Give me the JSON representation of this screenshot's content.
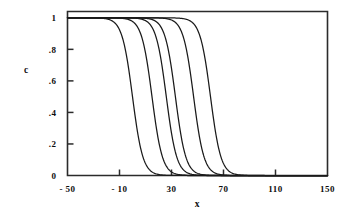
{
  "chart_data": {
    "type": "line",
    "title": "",
    "subtitle": "",
    "xlabel": "x",
    "ylabel": "c",
    "xlim": [
      -50,
      150
    ],
    "ylim": [
      0,
      1.04
    ],
    "grid": false,
    "legend": "none",
    "annotations": [],
    "x_ticks": [
      -50,
      -10,
      30,
      70,
      110,
      150
    ],
    "x_ticklabels": [
      "- 50",
      "- 10",
      "30",
      "70",
      "110",
      "150"
    ],
    "y_ticks": [
      0,
      0.2,
      0.4,
      0.6,
      0.8,
      1
    ],
    "y_ticklabels": [
      "0",
      ".2",
      ".4",
      ".6",
      ".8",
      "1"
    ],
    "y_tickmarks_drawn": [
      0.2,
      0.4,
      0.6,
      0.8
    ],
    "frame": "box",
    "series": [
      {
        "name": "front-1",
        "midpoint": 0,
        "width": 4.0,
        "plateau": 1.0,
        "baseline": 0.0
      },
      {
        "name": "front-2",
        "midpoint": 15,
        "width": 4.0,
        "plateau": 1.0,
        "baseline": 0.0
      },
      {
        "name": "front-3",
        "midpoint": 26,
        "width": 4.0,
        "plateau": 1.0,
        "baseline": 0.0
      },
      {
        "name": "front-4",
        "midpoint": 33,
        "width": 4.0,
        "plateau": 1.0,
        "baseline": 0.0
      },
      {
        "name": "front-5",
        "midpoint": 47,
        "width": 4.0,
        "plateau": 1.0,
        "baseline": 0.0
      },
      {
        "name": "front-6",
        "midpoint": 60,
        "width": 4.0,
        "plateau": 1.0,
        "baseline": 0.0
      }
    ],
    "series_description": "Six sigmoidal descending fronts c(x) = 1/(1+exp((x-midpoint)/width)), each starting at c=1 on the left plateau and decaying to c=0 on the right."
  },
  "axes": {
    "x_title": "x",
    "y_title": "c"
  }
}
